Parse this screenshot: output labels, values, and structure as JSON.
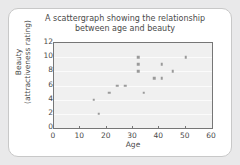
{
  "chart_data": {
    "type": "scatter",
    "title": "A scattergraph showing the relationship between age and beauty",
    "title_line1": "A scattergraph showing the relationship",
    "title_line2": "between age and beauty",
    "xlabel": "Age",
    "ylabel": "Beauty (attractiveness rating)",
    "ylabel_line1": "Beauty",
    "ylabel_line2": "(attractiveness rating)",
    "xlim": [
      0,
      60
    ],
    "ylim": [
      0,
      12
    ],
    "xticks": [
      0,
      10,
      20,
      30,
      40,
      50,
      60
    ],
    "yticks": [
      0,
      2,
      4,
      6,
      8,
      10,
      12
    ],
    "grid": "horizontal",
    "legend": "none",
    "marker_color": "#9a9a9a",
    "plot_background": "#f0f0f0",
    "axis_color": "#767676",
    "points": [
      {
        "x": 15,
        "y": 4
      },
      {
        "x": 17,
        "y": 2
      },
      {
        "x": 21,
        "y": 5
      },
      {
        "x": 24,
        "y": 6
      },
      {
        "x": 27,
        "y": 6
      },
      {
        "x": 32,
        "y": 10
      },
      {
        "x": 32,
        "y": 9
      },
      {
        "x": 32,
        "y": 8
      },
      {
        "x": 34,
        "y": 5
      },
      {
        "x": 38,
        "y": 7
      },
      {
        "x": 41,
        "y": 9
      },
      {
        "x": 41,
        "y": 7
      },
      {
        "x": 45,
        "y": 8
      },
      {
        "x": 50,
        "y": 10
      }
    ]
  },
  "card": {
    "background": "#ffffff",
    "border_color": "#c8c8c8"
  },
  "page": {
    "background": "#e9e9ea"
  }
}
